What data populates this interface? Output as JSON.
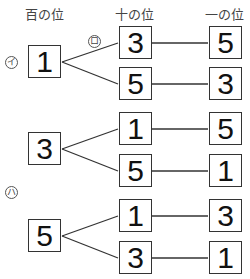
{
  "headers": {
    "hundreds": "百の位",
    "tens": "十の位",
    "ones": "一の位"
  },
  "labels": {
    "a": "イ",
    "b": "ロ",
    "c": "ハ"
  },
  "groups": [
    {
      "hundreds": "1",
      "branches": [
        {
          "tens": "3",
          "ones": "5"
        },
        {
          "tens": "5",
          "ones": "3"
        }
      ]
    },
    {
      "hundreds": "3",
      "branches": [
        {
          "tens": "1",
          "ones": "5"
        },
        {
          "tens": "5",
          "ones": "1"
        }
      ]
    },
    {
      "hundreds": "5",
      "branches": [
        {
          "tens": "1",
          "ones": "3"
        },
        {
          "tens": "3",
          "ones": "1"
        }
      ]
    }
  ],
  "colors": {
    "line": "#333333",
    "text": "#111111"
  }
}
